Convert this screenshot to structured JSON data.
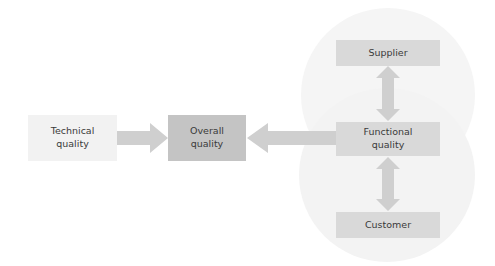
{
  "diagram": {
    "nodes": {
      "technical": {
        "label_line1": "Technical",
        "label_line2": "quality"
      },
      "overall": {
        "label_line1": "Overall",
        "label_line2": "quality"
      },
      "functional": {
        "label_line1": "Functional",
        "label_line2": "quality"
      },
      "supplier": {
        "label": "Supplier"
      },
      "customer": {
        "label": "Customer"
      }
    },
    "edges": [
      {
        "from": "Technical quality",
        "to": "Overall quality",
        "type": "single-arrow"
      },
      {
        "from": "Functional quality",
        "to": "Overall quality",
        "type": "single-arrow"
      },
      {
        "from": "Supplier",
        "to": "Functional quality",
        "type": "double-arrow"
      },
      {
        "from": "Functional quality",
        "to": "Customer",
        "type": "double-arrow"
      }
    ],
    "colors": {
      "technical_fill": "#f2f2f2",
      "overall_fill": "#c4c4c4",
      "node_fill": "#d9d9d9",
      "arrow_fill": "#cfcfcf",
      "circle_fill": "#f5f5f5"
    }
  }
}
